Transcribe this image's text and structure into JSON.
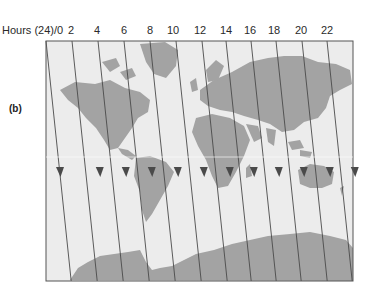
{
  "figure": {
    "panel_label": "(b)",
    "axis_title": "Hours (24)/0",
    "hour_ticks": [
      "2",
      "4",
      "6",
      "8",
      "10",
      "12",
      "14",
      "16",
      "18",
      "20",
      "22"
    ],
    "colors": {
      "ocean": "#ececec",
      "land": "#a3a3a3",
      "lines": "#4a4a4a",
      "frame": "#555555"
    }
  }
}
